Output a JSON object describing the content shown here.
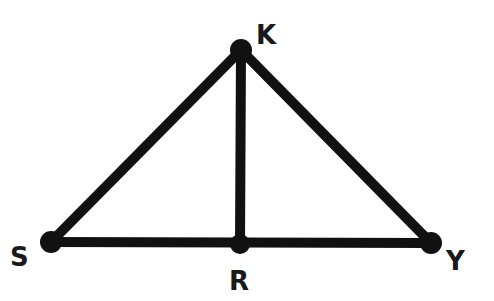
{
  "diagram": {
    "type": "geometry",
    "stroke_color": "#111111",
    "background": "#ffffff",
    "points": [
      {
        "id": "K",
        "label": "K",
        "x": 241,
        "y": 50
      },
      {
        "id": "S",
        "label": "S",
        "x": 51,
        "y": 242
      },
      {
        "id": "R",
        "label": "R",
        "x": 240,
        "y": 244
      },
      {
        "id": "Y",
        "label": "Y",
        "x": 431,
        "y": 243
      }
    ],
    "segments": [
      {
        "from": "S",
        "to": "K"
      },
      {
        "from": "K",
        "to": "Y"
      },
      {
        "from": "S",
        "to": "Y"
      },
      {
        "from": "K",
        "to": "R"
      }
    ],
    "labels": {
      "K": {
        "text": "K",
        "x": 256,
        "y": 44
      },
      "S": {
        "text": "S",
        "x": 10,
        "y": 266
      },
      "R": {
        "text": "R",
        "x": 229,
        "y": 290
      },
      "Y": {
        "text": "Y",
        "x": 446,
        "y": 270
      }
    }
  }
}
